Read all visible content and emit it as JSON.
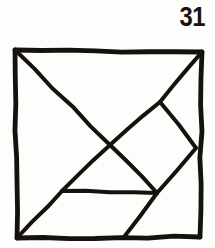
{
  "figure": {
    "kind": "tangram-dissection-diagram",
    "label": "31",
    "ink_color": "#14110e",
    "background_color": "#fdfdfb",
    "stroke_width": 4,
    "outline": {
      "name": "square-outline",
      "points": [
        [
          15,
          50
        ],
        [
          202,
          52
        ],
        [
          200,
          237
        ],
        [
          17,
          238
        ]
      ]
    },
    "interior_lines": [
      {
        "name": "main-diagonal-upper",
        "from": [
          15,
          50
        ],
        "to": [
          110,
          145
        ]
      },
      {
        "name": "main-diagonal-lower",
        "from": [
          110,
          145
        ],
        "to": [
          157,
          193
        ]
      },
      {
        "name": "anti-diagonal-upper",
        "from": [
          202,
          52
        ],
        "to": [
          160,
          102
        ]
      },
      {
        "name": "anti-diagonal-middle",
        "from": [
          160,
          102
        ],
        "to": [
          110,
          145
        ]
      },
      {
        "name": "anti-diagonal-lower",
        "from": [
          110,
          145
        ],
        "to": [
          62,
          191
        ]
      },
      {
        "name": "right-upper-branch",
        "from": [
          160,
          102
        ],
        "to": [
          196,
          148
        ]
      },
      {
        "name": "right-lower-branch",
        "from": [
          196,
          148
        ],
        "to": [
          157,
          193
        ]
      },
      {
        "name": "horizontal-chord",
        "from": [
          62,
          191
        ],
        "to": [
          157,
          193
        ]
      },
      {
        "name": "bottom-left-diagonal",
        "from": [
          17,
          238
        ],
        "to": [
          62,
          191
        ]
      },
      {
        "name": "bottom-right-diagonal",
        "from": [
          157,
          193
        ],
        "to": [
          124,
          237
        ]
      }
    ],
    "vertices": [
      {
        "name": "corner-top-left",
        "at": [
          15,
          50
        ]
      },
      {
        "name": "corner-top-right",
        "at": [
          202,
          52
        ]
      },
      {
        "name": "corner-bottom-right",
        "at": [
          200,
          237
        ]
      },
      {
        "name": "corner-bottom-left",
        "at": [
          17,
          238
        ]
      },
      {
        "name": "center-crossing",
        "at": [
          110,
          145
        ]
      },
      {
        "name": "upper-right-node",
        "at": [
          160,
          102
        ]
      },
      {
        "name": "right-edge-node",
        "at": [
          196,
          148
        ]
      },
      {
        "name": "lower-right-node",
        "at": [
          157,
          193
        ]
      },
      {
        "name": "lower-left-node",
        "at": [
          62,
          191
        ]
      },
      {
        "name": "bottom-edge-node",
        "at": [
          124,
          237
        ]
      }
    ]
  }
}
